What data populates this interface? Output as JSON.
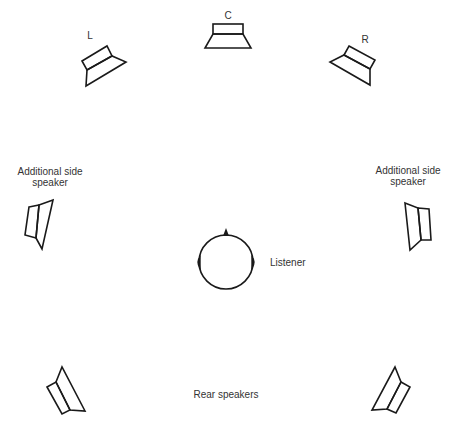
{
  "diagram": {
    "type": "surround-speaker-layout",
    "labels": {
      "center": "C",
      "left": "L",
      "right": "R",
      "side_left": [
        "Additional side",
        "speaker"
      ],
      "side_right": [
        "Additional side",
        "speaker"
      ],
      "listener": "Listener",
      "rear": "Rear speakers"
    },
    "speakers": [
      {
        "id": "center",
        "label": "C"
      },
      {
        "id": "front-left",
        "label": "L"
      },
      {
        "id": "front-right",
        "label": "R"
      },
      {
        "id": "side-left",
        "label": "Additional side speaker"
      },
      {
        "id": "side-right",
        "label": "Additional side speaker"
      },
      {
        "id": "rear-left",
        "label": "Rear speakers"
      },
      {
        "id": "rear-right",
        "label": "Rear speakers"
      }
    ],
    "listener": {
      "label": "Listener"
    },
    "colors": {
      "stroke": "#1a1a1a",
      "text": "#333333",
      "background": "#ffffff"
    }
  }
}
